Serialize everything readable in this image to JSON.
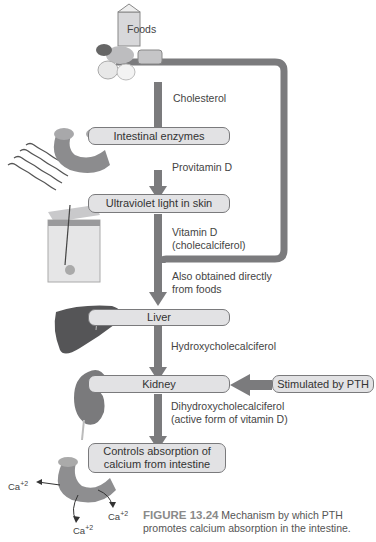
{
  "diagram": {
    "nodes": {
      "foods": "Foods",
      "intestinal_enzymes": "Intestinal enzymes",
      "uv_skin": "Ultraviolet light in skin",
      "liver": "Liver",
      "kidney": "Kidney",
      "pth": "Stimulated by PTH",
      "controls_line1": "Controls absorption of",
      "controls_line2": "calcium from intestine"
    },
    "labels": {
      "cholesterol": "Cholesterol",
      "provitamin": "Provitamin D",
      "vitd_line1": "Vitamin D",
      "vitd_line2": "(cholecalciferol)",
      "also_line1": "Also obtained directly",
      "also_line2": "from foods",
      "hydroxy": "Hydroxycholecalciferol",
      "dihydroxy_line1": "Dihydroxycholecalciferol",
      "dihydroxy_line2": "(active form of vitamin D)"
    },
    "ions": {
      "ca_base": "Ca",
      "ca_charge": "+2"
    },
    "colors": {
      "arrow": "#7b7b7d",
      "box_fill": "#e2e2e4",
      "box_border": "#7a7a7c"
    }
  },
  "caption": {
    "figure_label": "FIGURE 13.24",
    "line1": "Mechanism by which PTH",
    "line2": "promotes calcium absorption in the intestine."
  }
}
